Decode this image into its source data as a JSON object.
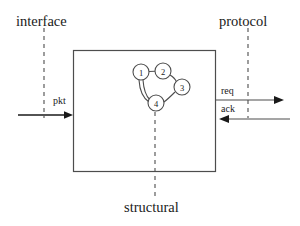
{
  "diagram": {
    "title_labels": {
      "interface": "interface",
      "protocol": "protocol",
      "structural": "structural"
    },
    "message_labels": {
      "pkt": "pkt",
      "req": "req",
      "ack": "ack"
    },
    "nodes": [
      {
        "id": "1",
        "label": "1",
        "cx": 141,
        "cy": 72,
        "r": 8
      },
      {
        "id": "2",
        "label": "2",
        "cx": 163,
        "cy": 71,
        "r": 8
      },
      {
        "id": "3",
        "label": "3",
        "cx": 182,
        "cy": 87,
        "r": 8
      },
      {
        "id": "4",
        "label": "4",
        "cx": 156,
        "cy": 103,
        "r": 8
      }
    ],
    "edges": [
      {
        "from": "1",
        "to": "2"
      },
      {
        "from": "2",
        "to": "3"
      },
      {
        "from": "3",
        "to": "4"
      },
      {
        "from": "4",
        "to": "1"
      },
      {
        "from": "1",
        "to": "4"
      }
    ],
    "box": {
      "x": 73,
      "y": 50,
      "width": 143,
      "height": 122
    },
    "colors": {
      "line": "#4d4d4d",
      "arrow": "#1a1a1a",
      "text": "#1a1a1a",
      "background": "#ffffff"
    }
  }
}
